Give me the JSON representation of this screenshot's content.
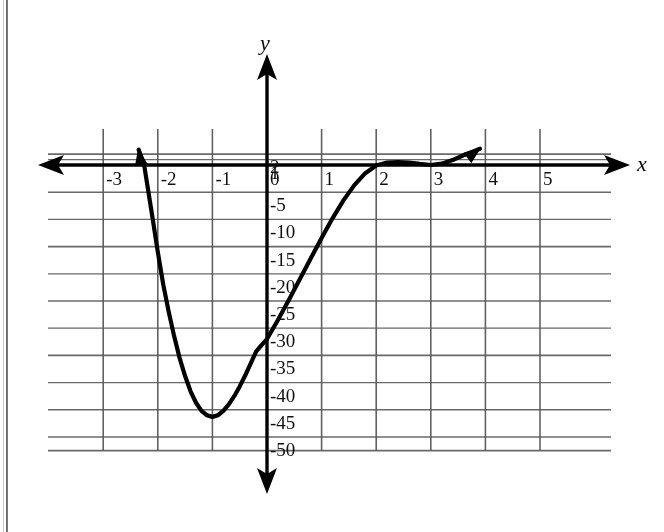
{
  "figure": {
    "kind": "coordinate-grid-graph",
    "background_color": "#ffffff",
    "ink_color": "#101010",
    "grid_color": "#5a5a5a",
    "axis_color": "#000000",
    "curve_color": "#000000"
  },
  "axes": {
    "x_axis_label": "x",
    "y_axis_label": "y",
    "x_ticks": [
      "-3",
      "-2",
      "-1",
      "0",
      "1",
      "2",
      "3",
      "4",
      "5"
    ],
    "y_ticks": [
      "2",
      "1",
      "0",
      "-5",
      "-10",
      "-15",
      "-20",
      "-25",
      "-30",
      "-35",
      "-40",
      "-45",
      "-50"
    ],
    "zero_label": "0"
  },
  "chart_data": {
    "type": "line",
    "title": "",
    "xlabel": "x",
    "ylabel": "y",
    "grid": true,
    "legend": "none",
    "xlim": [
      -3.6,
      5.8
    ],
    "ylim": [
      -53,
      3.2
    ],
    "x_ticks": [
      -3,
      -2,
      -1,
      0,
      1,
      2,
      3,
      4,
      5
    ],
    "y_ticks": [
      2,
      1,
      0,
      -5,
      -10,
      -15,
      -20,
      -25,
      -30,
      -35,
      -40,
      -45,
      -50
    ],
    "x_major_step": 1,
    "y_major_step": 5,
    "series": [
      {
        "name": "polynomial curve",
        "x": [
          -2.35,
          -2.25,
          -2.1,
          -2.0,
          -1.9,
          -1.8,
          -1.7,
          -1.6,
          -1.5,
          -1.4,
          -1.3,
          -1.2,
          -1.1,
          -1.0,
          -0.9,
          -0.8,
          -0.7,
          -0.6,
          -0.5,
          -0.4,
          -0.3,
          -0.2,
          -0.1,
          0.0,
          0.2,
          0.4,
          0.6,
          0.8,
          1.0,
          1.2,
          1.4,
          1.6,
          1.8,
          2.0,
          2.2,
          2.4,
          2.6,
          2.8,
          3.0,
          3.2,
          3.4,
          3.6,
          3.8,
          3.9
        ],
        "y": [
          2.8,
          0.0,
          -9.5,
          -16.0,
          -22.0,
          -27.0,
          -31.5,
          -35.5,
          -38.8,
          -41.6,
          -43.7,
          -45.2,
          -46.0,
          -46.3,
          -46.0,
          -45.2,
          -44.0,
          -42.5,
          -40.7,
          -38.7,
          -36.5,
          -34.3,
          -33.1,
          -32.0,
          -28.5,
          -24.8,
          -21.0,
          -17.2,
          -13.4,
          -9.8,
          -6.5,
          -3.7,
          -1.5,
          -0.1,
          0.45,
          0.55,
          0.45,
          0.2,
          0.0,
          0.25,
          0.9,
          1.8,
          2.6,
          3.0
        ]
      }
    ],
    "annotations": {
      "roots_visible": [
        "-2.25",
        "3.0"
      ],
      "local_minimum": {
        "x": -1.0,
        "y": -46
      },
      "y_intercept": -32,
      "near_tangency": {
        "x": 2.0,
        "y": 0
      },
      "left_branch_arrow": "up",
      "right_branch_arrow": "up"
    }
  }
}
